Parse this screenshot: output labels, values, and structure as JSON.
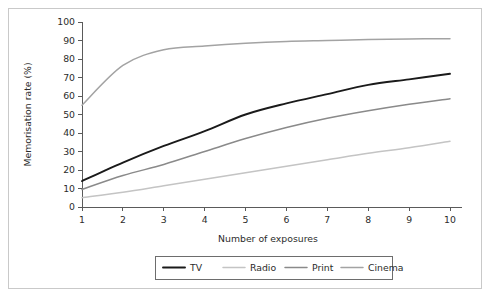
{
  "chart_data": {
    "type": "line",
    "title": "",
    "subtitle": "",
    "xlabel": "Number of exposures",
    "ylabel": "Memorisation rate (%)",
    "x": [
      1,
      2,
      3,
      4,
      5,
      6,
      7,
      8,
      9,
      10
    ],
    "xtick_labels": [
      "1",
      "2",
      "3",
      "4",
      "5",
      "6",
      "7",
      "8",
      "9",
      "10"
    ],
    "ytick_labels": [
      "0",
      "10",
      "20",
      "30",
      "40",
      "50",
      "60",
      "70",
      "80",
      "90",
      "100"
    ],
    "ytick_values": [
      0,
      10,
      20,
      30,
      40,
      50,
      60,
      70,
      80,
      90,
      100
    ],
    "xlim": [
      1,
      10
    ],
    "ylim": [
      0,
      100
    ],
    "grid": false,
    "legend_position": "bottom",
    "series": [
      {
        "name": "TV",
        "color": "#1a1a1a",
        "width": 1.9,
        "values": [
          14,
          24,
          33,
          41,
          50,
          56,
          61,
          66,
          69,
          72
        ]
      },
      {
        "name": "Radio",
        "color": "#c4c4c4",
        "width": 1.5,
        "values": [
          5,
          8,
          11.5,
          15,
          18.5,
          22,
          25.5,
          29,
          32,
          35.5
        ]
      },
      {
        "name": "Print",
        "color": "#8a8a8a",
        "width": 1.5,
        "values": [
          9.5,
          17,
          23,
          30,
          37,
          43,
          48,
          52,
          55.5,
          58.5
        ]
      },
      {
        "name": "Cinema",
        "color": "#a3a3a3",
        "width": 1.5,
        "values": [
          55,
          76.5,
          85,
          87,
          88.5,
          89.5,
          90,
          90.5,
          90.8,
          91
        ]
      }
    ]
  },
  "legend": {
    "entries": [
      {
        "label": "TV"
      },
      {
        "label": "Radio"
      },
      {
        "label": "Print"
      },
      {
        "label": "Cinema"
      }
    ]
  },
  "colors": {
    "background": "#ffffff",
    "frame": "#c9c9c9",
    "axis": "#5a5a5a",
    "text": "#2b2b2b"
  }
}
